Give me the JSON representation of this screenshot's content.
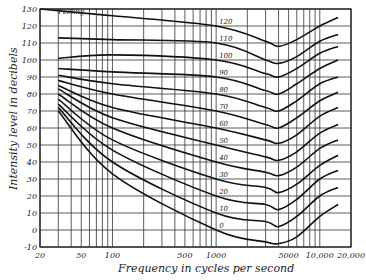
{
  "chart_data": {
    "type": "line",
    "title": "",
    "xlabel": "Frequency in cycles per second",
    "ylabel": "Intensity level in decibels",
    "x_scale": "log",
    "xlim": [
      20,
      20000
    ],
    "ylim": [
      -10,
      130
    ],
    "grid": true,
    "x_tick_labels": [
      "20",
      "50",
      "100",
      "500",
      "1000",
      "5000",
      "10,000",
      "20,000"
    ],
    "x_tick_values": [
      20,
      50,
      100,
      500,
      1000,
      5000,
      10000,
      20000
    ],
    "x_gridlines": [
      20,
      30,
      40,
      50,
      60,
      70,
      80,
      90,
      100,
      200,
      300,
      400,
      500,
      600,
      700,
      800,
      900,
      1000,
      2000,
      3000,
      4000,
      5000,
      6000,
      7000,
      8000,
      9000,
      10000,
      20000
    ],
    "y_tick_labels": [
      "130",
      "120",
      "110",
      "100",
      "90",
      "80",
      "70",
      "60",
      "50",
      "40",
      "30",
      "20",
      "10",
      "0",
      "-10"
    ],
    "y_tick_values": [
      130,
      120,
      110,
      100,
      90,
      80,
      70,
      60,
      50,
      40,
      30,
      20,
      10,
      0,
      -10
    ],
    "annotations": [
      {
        "text": "Feeling",
        "x": 30,
        "y": 127
      }
    ],
    "series": [
      {
        "name": "120",
        "x": [
          20,
          100,
          1000,
          3000,
          4000,
          6000,
          10000,
          15000
        ],
        "y": [
          130,
          126,
          120,
          111,
          108,
          112,
          120,
          125
        ]
      },
      {
        "name": "110",
        "x": [
          30,
          100,
          1000,
          3000,
          4000,
          6000,
          10000,
          15000
        ],
        "y": [
          113,
          112,
          110,
          100,
          98,
          102,
          111,
          115
        ]
      },
      {
        "name": "100",
        "x": [
          30,
          100,
          1000,
          3000,
          4000,
          6000,
          10000,
          15000
        ],
        "y": [
          101,
          103,
          100,
          92,
          90,
          95,
          104,
          108
        ]
      },
      {
        "name": "90",
        "x": [
          30,
          100,
          1000,
          3000,
          4000,
          6000,
          10000,
          15000
        ],
        "y": [
          95,
          93,
          90,
          82,
          80,
          86,
          95,
          100
        ]
      },
      {
        "name": "80",
        "x": [
          30,
          100,
          1000,
          3000,
          4000,
          6000,
          10000,
          15000
        ],
        "y": [
          91,
          86,
          80,
          72,
          70,
          76,
          86,
          90
        ]
      },
      {
        "name": "70",
        "x": [
          30,
          100,
          1000,
          3000,
          4000,
          6000,
          10000,
          15000
        ],
        "y": [
          88,
          80,
          70,
          62,
          60,
          66,
          76,
          81
        ]
      },
      {
        "name": "60",
        "x": [
          30,
          100,
          1000,
          3000,
          4000,
          6000,
          10000,
          15000
        ],
        "y": [
          85,
          72,
          60,
          53,
          51,
          56,
          67,
          72
        ]
      },
      {
        "name": "50",
        "x": [
          30,
          100,
          1000,
          3000,
          4000,
          6000,
          10000,
          15000
        ],
        "y": [
          83,
          66,
          50,
          43,
          41,
          46,
          57,
          62
        ]
      },
      {
        "name": "40",
        "x": [
          30,
          100,
          1000,
          3000,
          4000,
          6000,
          10000,
          15000
        ],
        "y": [
          80,
          60,
          40,
          34,
          32,
          37,
          48,
          53
        ]
      },
      {
        "name": "30",
        "x": [
          30,
          100,
          1000,
          3000,
          4000,
          6000,
          10000,
          15000
        ],
        "y": [
          77,
          53,
          30,
          25,
          22,
          27,
          38,
          44
        ]
      },
      {
        "name": "20",
        "x": [
          30,
          100,
          1000,
          3000,
          4000,
          6000,
          10000,
          15000
        ],
        "y": [
          74,
          47,
          20,
          15,
          12,
          18,
          30,
          35
        ]
      },
      {
        "name": "10",
        "x": [
          30,
          100,
          1000,
          3000,
          4000,
          6000,
          10000,
          15000
        ],
        "y": [
          72,
          40,
          10,
          5,
          2,
          8,
          20,
          25
        ]
      },
      {
        "name": "0",
        "x": [
          30,
          100,
          1000,
          3000,
          4000,
          6000,
          10000,
          15000
        ],
        "y": [
          70,
          33,
          0,
          -7,
          -8,
          -4,
          8,
          15
        ]
      }
    ],
    "curve_label_x": 1000
  }
}
